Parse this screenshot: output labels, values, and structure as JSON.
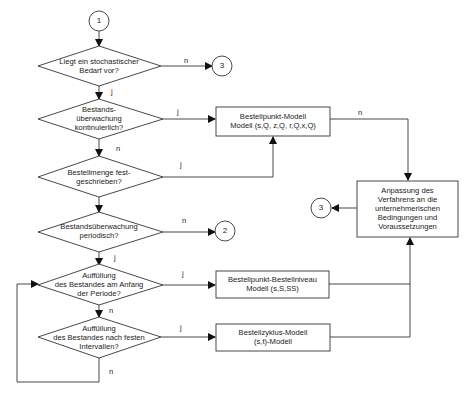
{
  "diagram": {
    "type": "flowchart",
    "connectors": {
      "start": "1",
      "top_right": "3",
      "periodic_no": "2",
      "adaptation_out": "3"
    },
    "decisions": [
      {
        "id": "d1",
        "lines": [
          "Liegt ein stochastischer",
          "Bedarf vor?"
        ],
        "yes": "j",
        "no": "n"
      },
      {
        "id": "d2",
        "lines": [
          "Bestands-",
          "überwachung",
          "kontinuierlich?"
        ],
        "yes": "j",
        "no": "n"
      },
      {
        "id": "d3",
        "lines": [
          "Bestellmenge fest-",
          "geschrieben?"
        ],
        "yes": "j"
      },
      {
        "id": "d4",
        "lines": [
          "Bestandsüberwachung",
          "periodisch?"
        ],
        "yes": "j",
        "no": "n"
      },
      {
        "id": "d5",
        "lines": [
          "Auffüllung",
          "des Bestandes am Anfang",
          "der Periode?"
        ],
        "yes": "j",
        "no": "n"
      },
      {
        "id": "d6",
        "lines": [
          "Auffüllung",
          "des Bestandes nach festen",
          "Intervallen?"
        ],
        "yes": "j",
        "no": "n"
      }
    ],
    "processes": [
      {
        "id": "p1",
        "lines": [
          "Bestellpunkt-Modell",
          "Modell (s,Q, z,Q, r,Q,x,Q)"
        ],
        "out_label": "n"
      },
      {
        "id": "p2",
        "lines": [
          "Bestellpunkt-Bestellniveau",
          "Modell (s,S,SS)"
        ]
      },
      {
        "id": "p3",
        "lines": [
          "Bestellzyklus-Modell",
          "(s,t)-Modell"
        ]
      },
      {
        "id": "p4",
        "lines": [
          "Anpassung des",
          "Verfahrens an die",
          "unternehmerischen",
          "Bedingungen und",
          "Voraussetzungen"
        ]
      }
    ],
    "colors": {
      "stroke": "#222222",
      "background": "#ffffff"
    }
  }
}
